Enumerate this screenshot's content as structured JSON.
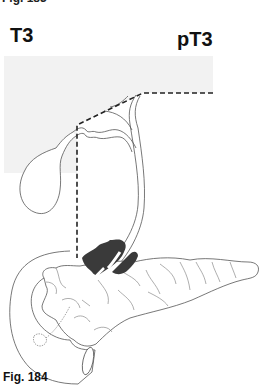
{
  "page": {
    "top_caption_cut": "Fig. 183",
    "figure_caption": "Fig. 184"
  },
  "figure": {
    "clinical_label": "T3",
    "pathologic_label": "pT3",
    "colors": {
      "shaded_region": "#f2f2f2",
      "outline": "#555555",
      "dashed_line": "#222222",
      "tumor": "#3a3a3a"
    }
  }
}
